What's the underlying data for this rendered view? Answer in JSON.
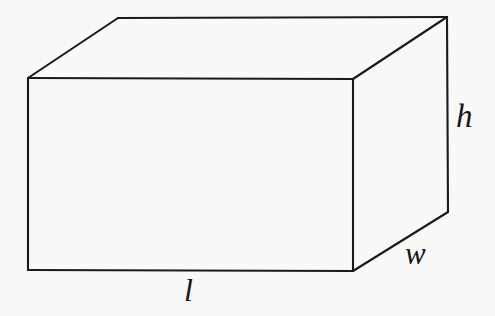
{
  "figure": {
    "shape": "rectangular-prism",
    "background_color": "#f8f8f7",
    "line_color": "#1a1a1a",
    "line_width": 2.1,
    "labels": {
      "length": "l",
      "width": "w",
      "height": "h"
    },
    "label_positions": {
      "length": {
        "x": 193,
        "y": 291
      },
      "width": {
        "x": 418,
        "y": 254
      },
      "height": {
        "x": 468,
        "y": 117
      }
    },
    "vertices": {
      "front_top_left": {
        "x": 28,
        "y": 78
      },
      "front_top_right": {
        "x": 353,
        "y": 79
      },
      "front_bottom_right": {
        "x": 353,
        "y": 271
      },
      "front_bottom_left": {
        "x": 28,
        "y": 270
      },
      "back_top_left": {
        "x": 118,
        "y": 18
      },
      "back_top_right": {
        "x": 447,
        "y": 17
      },
      "back_bottom_right": {
        "x": 448,
        "y": 212
      }
    },
    "edges": [
      "front-top-edge",
      "front-right-edge",
      "front-bottom-edge",
      "front-left-edge",
      "top-back-left-edge",
      "top-back-edge",
      "top-back-right-edge",
      "right-back-vertical-edge",
      "bottom-back-right-edge"
    ]
  }
}
